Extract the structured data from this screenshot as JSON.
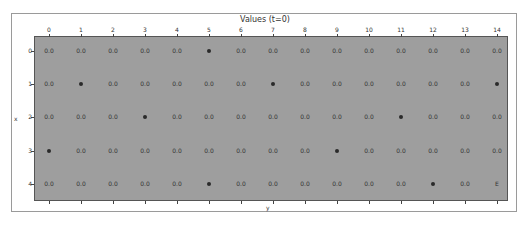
{
  "chart_data": {
    "type": "table",
    "title": "Values (t=0)",
    "xlabel": "y",
    "ylabel": "x",
    "x_ticks": [
      "0",
      "1",
      "2",
      "3",
      "4",
      "5",
      "6",
      "7",
      "8",
      "9",
      "10",
      "11",
      "12",
      "13",
      "14"
    ],
    "y_ticks": [
      "0",
      "1",
      "2",
      "3",
      "4"
    ],
    "grid": false,
    "background_color": "#9e9e9e",
    "cells": [
      [
        "0.0",
        "0.0",
        "0.0",
        "0.0",
        "0.0",
        "●",
        "0.0",
        "0.0",
        "0.0",
        "0.0",
        "0.0",
        "0.0",
        "0.0",
        "0.0",
        "0.0"
      ],
      [
        "0.0",
        "●",
        "0.0",
        "0.0",
        "0.0",
        "0.0",
        "0.0",
        "●",
        "0.0",
        "0.0",
        "0.0",
        "0.0",
        "0.0",
        "0.0",
        "●"
      ],
      [
        "0.0",
        "0.0",
        "0.0",
        "●",
        "0.0",
        "0.0",
        "0.0",
        "0.0",
        "0.0",
        "0.0",
        "0.0",
        "●",
        "0.0",
        "0.0",
        "0.0"
      ],
      [
        "●",
        "0.0",
        "0.0",
        "0.0",
        "0.0",
        "0.0",
        "0.0",
        "0.0",
        "0.0",
        "●",
        "0.0",
        "0.0",
        "0.0",
        "0.0",
        "0.0"
      ],
      [
        "0.0",
        "0.0",
        "0.0",
        "0.0",
        "0.0",
        "●",
        "0.0",
        "0.0",
        "0.0",
        "0.0",
        "0.0",
        "0.0",
        "●",
        "0.0",
        "E"
      ]
    ],
    "legend": {
      "●": "obstacle / wall marker",
      "E": "end / goal cell",
      "0.0": "state value"
    }
  }
}
